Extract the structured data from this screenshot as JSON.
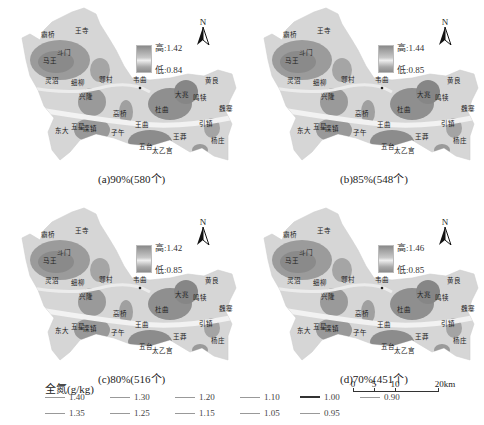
{
  "figure": {
    "panels": [
      {
        "id": "a",
        "caption": "(a)90%(580个)",
        "ramp_high": "高:1.42",
        "ramp_low": "低:0.84",
        "north": "N"
      },
      {
        "id": "b",
        "caption": "(b)85%(548个)",
        "ramp_high": "高:1.44",
        "ramp_low": "低:0.85",
        "north": "N"
      },
      {
        "id": "c",
        "caption": "(c)80%(516个)",
        "ramp_high": "高:1.42",
        "ramp_low": "低:0.85",
        "north": "N"
      },
      {
        "id": "d",
        "caption": "(d)70%(451个)",
        "ramp_high": "高:1.46",
        "ramp_low": "低:0.85",
        "north": "N"
      }
    ],
    "place_names": [
      "霸桥",
      "王寺",
      "斗门",
      "马王",
      "灵沼",
      "细柳",
      "鄠村",
      "韦曲",
      "兴隆",
      "大兆",
      "鸣犊",
      "魏寨",
      "黄良",
      "杜曲",
      "王曲",
      "引镇",
      "东大",
      "五星",
      "滦镇",
      "子午",
      "王莽",
      "杨庄",
      "五台",
      "太乙宫",
      "曲江"
    ],
    "legend": {
      "title": "全氮(g/kg)",
      "row1": [
        "1.40",
        "1.30",
        "1.20",
        "1.10",
        "1.00",
        "0.90"
      ],
      "row2": [
        "1.35",
        "1.25",
        "1.15",
        "1.05",
        "0.95"
      ]
    },
    "scale_bar": {
      "ticks": [
        "0",
        "5",
        "10",
        "20km"
      ]
    }
  },
  "colors": {
    "high": "#7f7f7f",
    "mid": "#efefef",
    "low": "#8c8c8c",
    "contour": "#ffffff"
  }
}
